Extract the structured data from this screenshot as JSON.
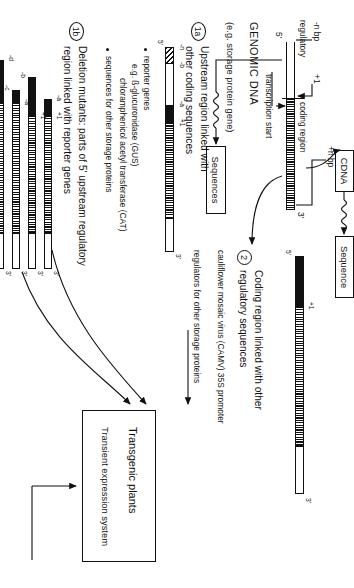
{
  "figure": {
    "orientation": "rotated-90"
  },
  "section_genomic": {
    "heading": "GENOMIC DNA",
    "subheading": "(e.g. storage protein gene)",
    "labels": {
      "minus_n_bp": "-n bp",
      "plus_one": "+1",
      "plus_n_bp": "+n bp",
      "regulatory_region": "regulatory\nregion",
      "regulatory_region_line1": "regulatory",
      "regulatory_region_line2": "region",
      "coding_region": "coding region",
      "transcription_start": "transcription start",
      "five_prime": "5'",
      "three_prime": "3'"
    }
  },
  "cdna": {
    "box_label": "CDNA",
    "sequence_box_label": "Sequence",
    "squiggle": "wwww"
  },
  "branch_1a": {
    "marker": "1a",
    "heading_line1": "Upstream region linked with",
    "heading_line2": "other coding sequences",
    "sequences_box_label": "Sequences",
    "construct_labels": {
      "minus_n": "-n",
      "minus_b": "-b",
      "minus_a": "-a",
      "plus_one": "+1",
      "five_prime": "5'",
      "three_prime": "3'"
    },
    "notes": [
      {
        "bullet": true,
        "text": "reporter genes"
      },
      {
        "bullet": false,
        "text": "e.g. ß-glucuronidase (GUS)"
      },
      {
        "bullet": false,
        "text": "chloramphenicol acetyl transferase (CAT)"
      },
      {
        "bullet": true,
        "text": "sequences for other storage proteins"
      }
    ]
  },
  "branch_1b": {
    "marker": "1b",
    "heading_line1": "Deletion mutants:  parts of 5' upstream regulatory",
    "heading_line2": "region linked with reporter genes",
    "constructs": [
      {
        "name": "construct-1",
        "left_label": "-a",
        "start_label": "+1",
        "three_prime": "3'"
      },
      {
        "name": "construct-2",
        "left_label": "-b",
        "start_label": "+1",
        "three_prime": "3'"
      },
      {
        "name": "construct-3",
        "left_label": "-c",
        "start_label": "-a",
        "three_prime": "3'"
      },
      {
        "name": "construct-4",
        "left_label": "-d",
        "start_label": "",
        "three_prime": "3'"
      }
    ]
  },
  "branch_2": {
    "marker": "2",
    "heading_line1": "Coding region linked with other",
    "heading_line2": "regulatory sequences",
    "construct_labels": {
      "plus_one": "+1",
      "five_prime": "5'",
      "three_prime": "3'"
    },
    "notes": [
      "cauliflower mosaic virus (CAMV) 35S promoter",
      "regulators for other storage proteins"
    ]
  },
  "outcome": {
    "box_title": "Transgenic plants",
    "box_subtitle": "Transient expression system"
  },
  "colors": {
    "ink": "#111111",
    "paper": "#ffffff"
  }
}
